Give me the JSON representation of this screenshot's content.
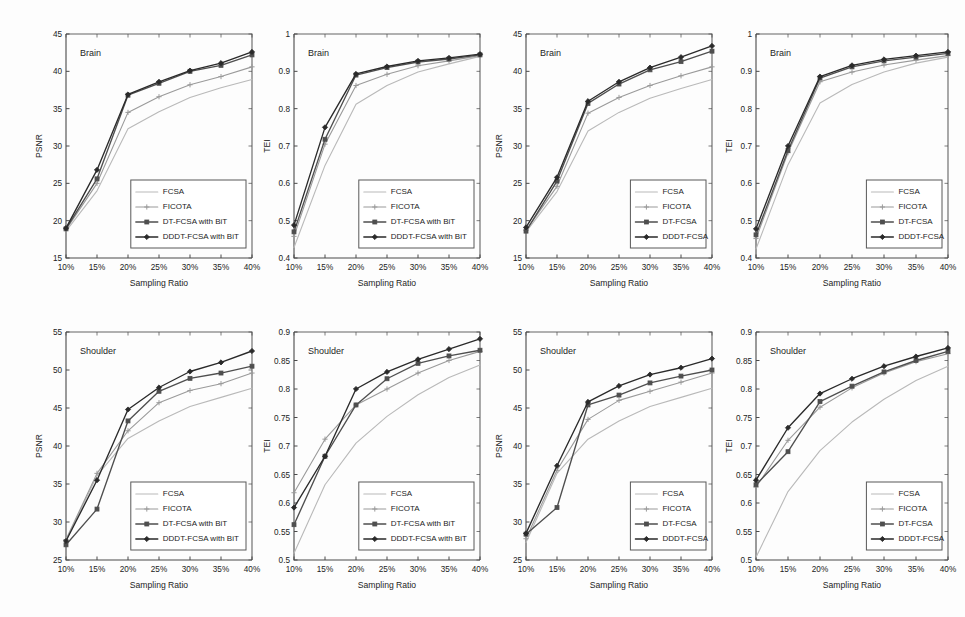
{
  "figure": {
    "panel_count": 8,
    "shared_xlabel": "Sampling Ratio",
    "x_tick_labels": [
      "10%",
      "15%",
      "20%",
      "25%",
      "30%",
      "35%",
      "40%"
    ],
    "series_names_bit": [
      "FCSA",
      "FICOTA",
      "DT-FCSA with BiT",
      "DDDT-FCSA with BiT"
    ],
    "series_names_plain": [
      "FCSA",
      "FICOTA",
      "DT-FCSA",
      "DDDT-FCSA"
    ],
    "colors": {
      "fcsa": "#b9b9b9",
      "ficota": "#9a9a9a",
      "dt": "#4f4f4f",
      "dddt": "#2a2a2a",
      "axis": "#4a4a4a",
      "background": "#fdfdfd"
    },
    "markers": {
      "fcsa": "none",
      "ficota": "plus",
      "dt": "square",
      "dddt": "diamond"
    }
  },
  "chart_data": [
    {
      "id": "panel-1",
      "type": "line",
      "title": "Brain",
      "annotation": "Brain",
      "xlabel": "Sampling Ratio",
      "ylabel": "PSNR",
      "x": [
        "10%",
        "15%",
        "20%",
        "25%",
        "30%",
        "35%",
        "40%"
      ],
      "xlim": [
        0,
        6
      ],
      "ylim": [
        15,
        45
      ],
      "y_ticks": [
        15,
        20,
        25,
        30,
        35,
        40,
        45
      ],
      "y_tick_labels": [
        "15",
        "20",
        "25",
        "30",
        "35",
        "40",
        "45"
      ],
      "grid": false,
      "legend_position": "lower-right",
      "legend_labels": [
        "FCSA",
        "FICOTA",
        "DT-FCSA with BiT",
        "DDDT-FCSA with BiT"
      ],
      "series": [
        {
          "name": "FCSA",
          "key": "fcsa",
          "values": [
            18.6,
            24.0,
            32.3,
            34.6,
            36.5,
            37.8,
            38.9
          ]
        },
        {
          "name": "FICOTA",
          "key": "ficota",
          "values": [
            18.8,
            25.0,
            34.5,
            36.6,
            38.2,
            39.3,
            40.6
          ]
        },
        {
          "name": "DT-FCSA with BiT",
          "key": "dt",
          "values": [
            18.9,
            25.6,
            36.8,
            38.4,
            40.0,
            40.8,
            42.2
          ]
        },
        {
          "name": "DDDT-FCSA with BiT",
          "key": "dddt",
          "values": [
            19.0,
            26.8,
            36.9,
            38.6,
            40.1,
            41.1,
            42.6
          ]
        }
      ]
    },
    {
      "id": "panel-2",
      "type": "line",
      "title": "Brain",
      "annotation": "Brain",
      "xlabel": "Sampling Ratio",
      "ylabel": "TEI",
      "x": [
        "10%",
        "15%",
        "20%",
        "25%",
        "30%",
        "35%",
        "40%"
      ],
      "xlim": [
        0,
        6
      ],
      "ylim": [
        0.4,
        1.0
      ],
      "y_ticks": [
        0.4,
        0.5,
        0.6,
        0.7,
        0.8,
        0.9,
        1.0
      ],
      "y_tick_labels": [
        "0.4",
        "0.5",
        "0.6",
        "0.7",
        "0.8",
        "0.9",
        "1"
      ],
      "grid": false,
      "legend_position": "lower-right",
      "legend_labels": [
        "FCSA",
        "FICOTA",
        "DT-FCSA with BiT",
        "DDDT-FCSA with BiT"
      ],
      "series": [
        {
          "name": "FCSA",
          "key": "fcsa",
          "values": [
            0.428,
            0.648,
            0.812,
            0.862,
            0.898,
            0.92,
            0.94
          ]
        },
        {
          "name": "FICOTA",
          "key": "ficota",
          "values": [
            0.458,
            0.705,
            0.862,
            0.892,
            0.915,
            0.928,
            0.942
          ]
        },
        {
          "name": "DT-FCSA with BiT",
          "key": "dt",
          "values": [
            0.47,
            0.718,
            0.89,
            0.91,
            0.925,
            0.933,
            0.944
          ]
        },
        {
          "name": "DDDT-FCSA with BiT",
          "key": "dddt",
          "values": [
            0.488,
            0.75,
            0.893,
            0.913,
            0.928,
            0.936,
            0.946
          ]
        }
      ]
    },
    {
      "id": "panel-3",
      "type": "line",
      "title": "Brain",
      "annotation": "Brain",
      "xlabel": "Sampling Ratio",
      "ylabel": "PSNR",
      "x": [
        "10%",
        "15%",
        "20%",
        "25%",
        "30%",
        "35%",
        "40%"
      ],
      "xlim": [
        0,
        6
      ],
      "ylim": [
        15,
        45
      ],
      "y_ticks": [
        15,
        20,
        25,
        30,
        35,
        40,
        45
      ],
      "y_tick_labels": [
        "15",
        "20",
        "25",
        "30",
        "35",
        "40",
        "45"
      ],
      "grid": false,
      "legend_position": "lower-right",
      "legend_labels": [
        "FCSA",
        "FICOTA",
        "DT-FCSA",
        "DDDT-FCSA"
      ],
      "series": [
        {
          "name": "FCSA",
          "key": "fcsa",
          "values": [
            18.5,
            23.9,
            32.0,
            34.5,
            36.4,
            37.7,
            38.9
          ]
        },
        {
          "name": "FICOTA",
          "key": "ficota",
          "values": [
            18.7,
            24.6,
            34.4,
            36.5,
            38.1,
            39.4,
            40.6
          ]
        },
        {
          "name": "DT-FCSA",
          "key": "dt",
          "values": [
            18.6,
            25.3,
            35.7,
            38.3,
            40.2,
            41.3,
            42.7
          ]
        },
        {
          "name": "DDDT-FCSA",
          "key": "dddt",
          "values": [
            19.1,
            25.8,
            36.0,
            38.6,
            40.5,
            41.9,
            43.4
          ]
        }
      ]
    },
    {
      "id": "panel-4",
      "type": "line",
      "title": "Brain",
      "annotation": "Brain",
      "xlabel": "Sampling Ratio",
      "ylabel": "TEI",
      "x": [
        "10%",
        "15%",
        "20%",
        "25%",
        "30%",
        "35%",
        "40%"
      ],
      "xlim": [
        0,
        6
      ],
      "ylim": [
        0.4,
        1.0
      ],
      "y_ticks": [
        0.4,
        0.5,
        0.6,
        0.7,
        0.8,
        0.9,
        1.0
      ],
      "y_tick_labels": [
        "0.4",
        "0.5",
        "0.6",
        "0.7",
        "0.8",
        "0.9",
        "1"
      ],
      "grid": false,
      "legend_position": "lower-right",
      "legend_labels": [
        "FCSA",
        "FICOTA",
        "DT-FCSA",
        "DDDT-FCSA"
      ],
      "series": [
        {
          "name": "FCSA",
          "key": "fcsa",
          "values": [
            0.424,
            0.65,
            0.815,
            0.865,
            0.898,
            0.922,
            0.938
          ]
        },
        {
          "name": "FICOTA",
          "key": "ficota",
          "values": [
            0.452,
            0.682,
            0.872,
            0.898,
            0.917,
            0.93,
            0.942
          ]
        },
        {
          "name": "DT-FCSA",
          "key": "dt",
          "values": [
            0.462,
            0.688,
            0.882,
            0.912,
            0.928,
            0.938,
            0.948
          ]
        },
        {
          "name": "DDDT-FCSA",
          "key": "dddt",
          "values": [
            0.478,
            0.7,
            0.886,
            0.916,
            0.932,
            0.942,
            0.952
          ]
        }
      ]
    },
    {
      "id": "panel-5",
      "type": "line",
      "title": "Shoulder",
      "annotation": "Shoulder",
      "xlabel": "Sampling Ratio",
      "ylabel": "PSNR",
      "x": [
        "10%",
        "15%",
        "20%",
        "25%",
        "30%",
        "35%",
        "40%"
      ],
      "xlim": [
        0,
        6
      ],
      "ylim": [
        25,
        55
      ],
      "y_ticks": [
        25,
        30,
        35,
        40,
        45,
        50,
        55
      ],
      "y_tick_labels": [
        "25",
        "30",
        "35",
        "40",
        "45",
        "50",
        "55"
      ],
      "grid": false,
      "legend_position": "lower-right",
      "legend_labels": [
        "FCSA",
        "FICOTA",
        "DT-FCSA with BiT",
        "DDDT-FCSA with BiT"
      ],
      "series": [
        {
          "name": "FCSA",
          "key": "fcsa",
          "values": [
            27.6,
            36.1,
            41.0,
            43.3,
            45.2,
            46.4,
            47.6
          ]
        },
        {
          "name": "FICOTA",
          "key": "ficota",
          "values": [
            27.7,
            36.4,
            42.0,
            45.7,
            47.3,
            48.2,
            49.6
          ]
        },
        {
          "name": "DT-FCSA with BiT",
          "key": "dt",
          "values": [
            27.0,
            31.7,
            43.3,
            47.2,
            48.9,
            49.6,
            50.5
          ]
        },
        {
          "name": "DDDT-FCSA with BiT",
          "key": "dddt",
          "values": [
            27.5,
            35.5,
            44.8,
            47.7,
            49.8,
            51.0,
            52.5
          ]
        }
      ]
    },
    {
      "id": "panel-6",
      "type": "line",
      "title": "Shoulder",
      "annotation": "Shoulder",
      "xlabel": "Sampling Ratio",
      "ylabel": "TEI",
      "x": [
        "10%",
        "15%",
        "20%",
        "25%",
        "30%",
        "35%",
        "40%"
      ],
      "xlim": [
        0.5,
        0.9
      ],
      "ylim": [
        0.5,
        0.9
      ],
      "y_ticks": [
        0.5,
        0.55,
        0.6,
        0.65,
        0.7,
        0.75,
        0.8,
        0.85,
        0.9
      ],
      "y_tick_labels": [
        "0.5",
        "0.55",
        "0.6",
        "0.65",
        "0.7",
        "0.75",
        "0.8",
        "0.85",
        "0.9"
      ],
      "grid": false,
      "legend_position": "lower-right",
      "legend_labels": [
        "FCSA",
        "FICOTA",
        "DT-FCSA with BiT",
        "DDDT-FCSA with BiT"
      ],
      "series": [
        {
          "name": "FCSA",
          "key": "fcsa",
          "values": [
            0.512,
            0.632,
            0.705,
            0.752,
            0.79,
            0.82,
            0.842
          ]
        },
        {
          "name": "FICOTA",
          "key": "ficota",
          "values": [
            0.618,
            0.712,
            0.772,
            0.8,
            0.828,
            0.85,
            0.866
          ]
        },
        {
          "name": "DT-FCSA with BiT",
          "key": "dt",
          "values": [
            0.562,
            0.682,
            0.772,
            0.818,
            0.845,
            0.858,
            0.868
          ]
        },
        {
          "name": "DDDT-FCSA with BiT",
          "key": "dddt",
          "values": [
            0.592,
            0.682,
            0.8,
            0.83,
            0.852,
            0.87,
            0.888
          ]
        }
      ]
    },
    {
      "id": "panel-7",
      "type": "line",
      "title": "Shoulder",
      "annotation": "Shoulder",
      "xlabel": "Sampling Ratio",
      "ylabel": "PSNR",
      "x": [
        "10%",
        "15%",
        "20%",
        "25%",
        "30%",
        "35%",
        "40%"
      ],
      "xlim": [
        0,
        6
      ],
      "ylim": [
        25,
        55
      ],
      "y_ticks": [
        25,
        30,
        35,
        40,
        45,
        50,
        55
      ],
      "y_tick_labels": [
        "25",
        "30",
        "35",
        "40",
        "45",
        "50",
        "55"
      ],
      "grid": false,
      "legend_position": "lower-right",
      "legend_labels": [
        "FCSA",
        "FICOTA",
        "DT-FCSA",
        "DDDT-FCSA"
      ],
      "series": [
        {
          "name": "FCSA",
          "key": "fcsa",
          "values": [
            27.3,
            36.4,
            40.9,
            43.3,
            45.2,
            46.4,
            47.6
          ]
        },
        {
          "name": "FICOTA",
          "key": "ficota",
          "values": [
            27.8,
            36.8,
            43.5,
            46.0,
            47.2,
            48.4,
            49.6
          ]
        },
        {
          "name": "DT-FCSA",
          "key": "dt",
          "values": [
            28.4,
            31.9,
            45.4,
            46.7,
            48.3,
            49.2,
            50.0
          ]
        },
        {
          "name": "DDDT-FCSA",
          "key": "dddt",
          "values": [
            28.5,
            37.4,
            45.8,
            47.9,
            49.4,
            50.3,
            51.5
          ]
        }
      ]
    },
    {
      "id": "panel-8",
      "type": "line",
      "title": "Shoulder",
      "annotation": "Shoulder",
      "xlabel": "Sampling Ratio",
      "ylabel": "TEI",
      "x": [
        "10%",
        "15%",
        "20%",
        "25%",
        "30%",
        "35%",
        "40%"
      ],
      "xlim": [
        0.5,
        0.9
      ],
      "ylim": [
        0.5,
        0.9
      ],
      "y_ticks": [
        0.5,
        0.55,
        0.6,
        0.65,
        0.7,
        0.75,
        0.8,
        0.85,
        0.9
      ],
      "y_tick_labels": [
        "0.5",
        "0.55",
        "0.6",
        "0.65",
        "0.7",
        "0.75",
        "0.8",
        "0.85",
        "0.9"
      ],
      "grid": false,
      "legend_position": "lower-right",
      "legend_labels": [
        "FCSA",
        "FICOTA",
        "DT-FCSA",
        "DDDT-FCSA"
      ],
      "series": [
        {
          "name": "FCSA",
          "key": "fcsa",
          "values": [
            0.505,
            0.62,
            0.692,
            0.742,
            0.782,
            0.815,
            0.84
          ]
        },
        {
          "name": "FICOTA",
          "key": "ficota",
          "values": [
            0.628,
            0.71,
            0.768,
            0.802,
            0.828,
            0.848,
            0.862
          ]
        },
        {
          "name": "DT-FCSA",
          "key": "dt",
          "values": [
            0.632,
            0.69,
            0.778,
            0.805,
            0.83,
            0.85,
            0.866
          ]
        },
        {
          "name": "DDDT-FCSA",
          "key": "dddt",
          "values": [
            0.64,
            0.732,
            0.792,
            0.818,
            0.84,
            0.857,
            0.872
          ]
        }
      ]
    }
  ]
}
